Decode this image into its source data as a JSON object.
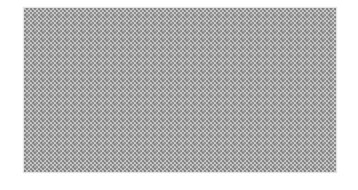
{
  "image": {
    "description": "Grey checkerboard dither pattern rectangle on white background",
    "pattern": {
      "type": "checkerboard-dither",
      "colors": {
        "dark": "#8e8e8e",
        "light": "#c8c8c8",
        "accent_dark": "#6e6e6e",
        "background": "#ffffff"
      },
      "bounds": {
        "left": 24,
        "top": 8,
        "right": 336,
        "bottom": 172
      }
    }
  }
}
